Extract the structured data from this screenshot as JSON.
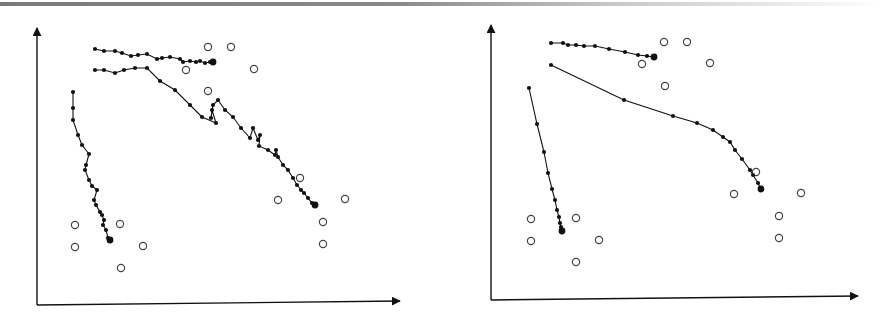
{
  "figure": {
    "panels": 2,
    "style": {
      "line_color": "#111111",
      "open_marker_color": "#444444",
      "rule_color": "#808080"
    }
  },
  "chart_data": [
    {
      "type": "scatter",
      "title": "",
      "xlabel": "",
      "ylabel": "",
      "grid": false,
      "legend": null,
      "axes": {
        "origin_px": [
          37,
          305
        ],
        "x_end_px": 400,
        "y_end_px": 28
      },
      "open_circles": [
        [
          208,
          47
        ],
        [
          231,
          47
        ],
        [
          186,
          70
        ],
        [
          254,
          69
        ],
        [
          208,
          91
        ],
        [
          300,
          178
        ],
        [
          278,
          200
        ],
        [
          345,
          199
        ],
        [
          323,
          222
        ],
        [
          323,
          244
        ],
        [
          75,
          225
        ],
        [
          120,
          224
        ],
        [
          75,
          247
        ],
        [
          143,
          246
        ],
        [
          121,
          268
        ]
      ],
      "series": [
        {
          "name": "trajectory-top",
          "points": [
            [
              95,
              49
            ],
            [
              104,
              51
            ],
            [
              115,
              51
            ],
            [
              122,
              53
            ],
            [
              131,
              56
            ],
            [
              138,
              55
            ],
            [
              147,
              54
            ],
            [
              157,
              59
            ],
            [
              162,
              58
            ],
            [
              170,
              57
            ],
            [
              180,
              59
            ],
            [
              183,
              62
            ],
            [
              190,
              61
            ],
            [
              196,
              62
            ],
            [
              200,
              61
            ],
            [
              205,
              63
            ],
            [
              210,
              62
            ],
            [
              213,
              62
            ]
          ]
        },
        {
          "name": "trajectory-diagonal",
          "points": [
            [
              95,
              70
            ],
            [
              104,
              70
            ],
            [
              115,
              73
            ],
            [
              124,
              70
            ],
            [
              135,
              68
            ],
            [
              147,
              68
            ],
            [
              160,
              81
            ],
            [
              175,
              90
            ],
            [
              190,
              105
            ],
            [
              202,
              117
            ],
            [
              216,
              123
            ],
            [
              212,
              110
            ],
            [
              211,
              118
            ],
            [
              213,
              105
            ],
            [
              218,
              100
            ],
            [
              225,
              110
            ],
            [
              233,
              117
            ],
            [
              241,
              128
            ],
            [
              250,
              138
            ],
            [
              253,
              128
            ],
            [
              258,
              140
            ],
            [
              260,
              135
            ],
            [
              259,
              146
            ],
            [
              268,
              150
            ],
            [
              275,
              155
            ],
            [
              276,
              150
            ],
            [
              278,
              157
            ],
            [
              283,
              165
            ],
            [
              288,
              170
            ],
            [
              293,
              178
            ],
            [
              297,
              185
            ],
            [
              301,
              190
            ],
            [
              304,
              193
            ],
            [
              308,
              198
            ],
            [
              312,
              203
            ],
            [
              315,
              205
            ]
          ]
        },
        {
          "name": "trajectory-left",
          "points": [
            [
              73,
              92
            ],
            [
              73,
              108
            ],
            [
              73,
              120
            ],
            [
              78,
              135
            ],
            [
              82,
              145
            ],
            [
              89,
              154
            ],
            [
              86,
              165
            ],
            [
              85,
              170
            ],
            [
              89,
              180
            ],
            [
              92,
              186
            ],
            [
              97,
              190
            ],
            [
              94,
              200
            ],
            [
              96,
              205
            ],
            [
              100,
              212
            ],
            [
              102,
              215
            ],
            [
              104,
              220
            ],
            [
              103,
              225
            ],
            [
              106,
              230
            ],
            [
              108,
              238
            ],
            [
              110,
              240
            ]
          ]
        }
      ]
    },
    {
      "type": "scatter",
      "title": "",
      "xlabel": "",
      "ylabel": "",
      "grid": false,
      "legend": null,
      "axes": {
        "origin_px": [
          491,
          300
        ],
        "x_end_px": 858,
        "y_end_px": 25
      },
      "open_circles": [
        [
          664,
          42
        ],
        [
          687,
          42
        ],
        [
          642,
          64
        ],
        [
          710,
          63
        ],
        [
          665,
          86
        ],
        [
          756,
          172
        ],
        [
          734,
          194
        ],
        [
          801,
          193
        ],
        [
          779,
          216
        ],
        [
          779,
          238
        ],
        [
          531,
          219
        ],
        [
          576,
          218
        ],
        [
          531,
          241
        ],
        [
          599,
          240
        ],
        [
          576,
          262
        ]
      ],
      "series": [
        {
          "name": "trajectory-top",
          "points": [
            [
              551,
              43
            ],
            [
              563,
              43
            ],
            [
              568,
              45
            ],
            [
              576,
              45
            ],
            [
              584,
              46
            ],
            [
              595,
              46
            ],
            [
              609,
              49
            ],
            [
              625,
              52
            ],
            [
              638,
              55
            ],
            [
              647,
              56
            ],
            [
              654,
              57
            ]
          ]
        },
        {
          "name": "trajectory-curve",
          "points": [
            [
              551,
              65
            ],
            [
              624,
              100
            ],
            [
              673,
              116
            ],
            [
              697,
              123
            ],
            [
              713,
              130
            ],
            [
              723,
              137
            ],
            [
              730,
              142
            ],
            [
              735,
              150
            ],
            [
              742,
              159
            ],
            [
              750,
              170
            ],
            [
              753,
              175
            ],
            [
              758,
              183
            ],
            [
              761,
              189
            ]
          ]
        },
        {
          "name": "trajectory-left",
          "points": [
            [
              529,
              88
            ],
            [
              537,
              124
            ],
            [
              544,
              152
            ],
            [
              548,
              173
            ],
            [
              552,
              189
            ],
            [
              555,
              200
            ],
            [
              557,
              210
            ],
            [
              559,
              217
            ],
            [
              560,
              223
            ],
            [
              561,
              227
            ],
            [
              562,
              231
            ]
          ]
        }
      ]
    }
  ]
}
